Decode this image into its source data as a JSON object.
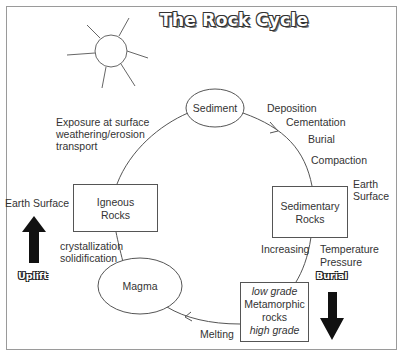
{
  "title": "The Rock Cycle",
  "nodes": {
    "sediment": "Sediment",
    "igneous": [
      "Igneous",
      "Rocks"
    ],
    "sedimentary": [
      "Sedimentary",
      "Rocks"
    ],
    "magma": "Magma",
    "metamorphic": {
      "low": "low grade",
      "name": [
        "Metamorphic",
        "rocks"
      ],
      "high": "high grade"
    }
  },
  "processes": {
    "exposure": [
      "Exposure at surface",
      "weathering/erosion",
      "transport"
    ],
    "deposition": "Deposition",
    "cementation": "Cementation",
    "burial": "Burial",
    "compaction": "Compaction",
    "earth_surface_right": [
      "Earth",
      "Surface"
    ],
    "earth_surface_left": "Earth Surface",
    "crystallization": [
      "crystallization",
      "solidification"
    ],
    "increasing": "Increasing",
    "temp_pressure": [
      "Temperature",
      "Pressure"
    ],
    "melting": "Melting"
  },
  "arrows": {
    "uplift": "Uplift",
    "burial": "Burial"
  },
  "colors": {
    "line": "#555555",
    "frame": "#888888",
    "arrow_fill": "#111111"
  }
}
